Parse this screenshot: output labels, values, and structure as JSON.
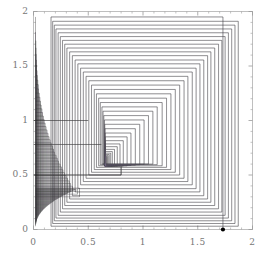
{
  "chart_data": {
    "type": "line",
    "title": "",
    "subtitle": "",
    "xlabel": "",
    "ylabel": "",
    "xlim": [
      0,
      2
    ],
    "ylim": [
      0,
      2
    ],
    "grid": false,
    "legend": null,
    "x_ticks": [
      0,
      0.5,
      1,
      1.5,
      2
    ],
    "y_ticks": [
      0,
      0.5,
      1,
      1.5,
      2
    ],
    "x_tick_labels": [
      "0",
      "0.5",
      "1",
      "1.5",
      "2"
    ],
    "y_tick_labels": [
      "0",
      "0.5",
      "1",
      "1.5",
      "2"
    ],
    "minor_ticks_per_interval": 5,
    "frame": true,
    "start_point": {
      "x": 1.73,
      "y": 0.0,
      "marker": "filled-circle"
    },
    "fixed_point": {
      "x": 0.655,
      "y": 0.58
    },
    "series": [
      {
        "name": "cobweb-orbit",
        "color": "#2a2a2a",
        "linewidth": 0.5,
        "vertices": [
          [
            1.73,
            0.0
          ],
          [
            1.73,
            1.95
          ],
          [
            0.16,
            1.95
          ],
          [
            0.16,
            0.03
          ],
          [
            1.87,
            0.03
          ],
          [
            1.87,
            1.91
          ],
          [
            0.175,
            1.91
          ],
          [
            0.175,
            0.055
          ],
          [
            1.84,
            0.055
          ],
          [
            1.84,
            1.875
          ],
          [
            0.19,
            1.875
          ],
          [
            0.19,
            0.08
          ],
          [
            1.81,
            0.08
          ],
          [
            1.81,
            1.84
          ],
          [
            0.205,
            1.84
          ],
          [
            0.205,
            0.105
          ],
          [
            1.78,
            0.105
          ],
          [
            1.78,
            1.805
          ],
          [
            0.225,
            1.805
          ],
          [
            0.225,
            0.13
          ],
          [
            1.75,
            0.13
          ],
          [
            1.75,
            1.77
          ],
          [
            0.245,
            1.77
          ],
          [
            0.245,
            0.16
          ],
          [
            1.72,
            0.16
          ],
          [
            1.72,
            1.735
          ],
          [
            0.265,
            1.735
          ],
          [
            0.265,
            0.19
          ],
          [
            1.69,
            0.19
          ],
          [
            1.69,
            1.7
          ],
          [
            0.285,
            1.7
          ],
          [
            0.285,
            0.22
          ],
          [
            1.655,
            0.22
          ],
          [
            1.655,
            1.665
          ],
          [
            0.305,
            1.665
          ],
          [
            0.305,
            0.25
          ],
          [
            1.62,
            0.25
          ],
          [
            1.62,
            1.63
          ],
          [
            0.33,
            1.63
          ],
          [
            0.33,
            0.28
          ],
          [
            1.59,
            0.28
          ],
          [
            1.59,
            1.595
          ],
          [
            0.355,
            1.595
          ],
          [
            0.355,
            0.31
          ],
          [
            1.555,
            0.31
          ],
          [
            1.555,
            1.555
          ],
          [
            0.38,
            1.555
          ],
          [
            0.38,
            0.345
          ],
          [
            1.52,
            0.345
          ],
          [
            1.52,
            1.52
          ],
          [
            0.405,
            1.52
          ],
          [
            0.405,
            0.375
          ],
          [
            1.485,
            0.375
          ],
          [
            1.485,
            1.48
          ],
          [
            0.43,
            1.48
          ],
          [
            0.43,
            0.41
          ],
          [
            1.45,
            0.41
          ],
          [
            1.45,
            1.445
          ],
          [
            0.455,
            1.445
          ],
          [
            0.455,
            0.44
          ],
          [
            1.41,
            0.44
          ],
          [
            1.41,
            1.405
          ],
          [
            0.48,
            1.405
          ],
          [
            0.48,
            0.47
          ],
          [
            1.375,
            0.47
          ],
          [
            1.375,
            1.365
          ],
          [
            0.505,
            1.365
          ],
          [
            0.505,
            0.5
          ],
          [
            1.335,
            0.5
          ],
          [
            1.335,
            1.325
          ],
          [
            0.53,
            1.325
          ],
          [
            0.53,
            0.525
          ],
          [
            1.295,
            0.525
          ],
          [
            1.295,
            1.285
          ],
          [
            0.555,
            1.285
          ],
          [
            0.555,
            0.55
          ],
          [
            1.255,
            0.55
          ],
          [
            1.255,
            1.245
          ],
          [
            0.575,
            1.245
          ],
          [
            0.575,
            0.57
          ],
          [
            1.215,
            0.57
          ],
          [
            1.215,
            1.205
          ],
          [
            0.595,
            1.205
          ],
          [
            0.595,
            0.585
          ],
          [
            1.175,
            0.585
          ],
          [
            1.175,
            1.165
          ],
          [
            0.61,
            1.165
          ],
          [
            0.61,
            0.595
          ],
          [
            1.13,
            0.595
          ],
          [
            1.13,
            1.125
          ],
          [
            0.625,
            1.125
          ],
          [
            0.625,
            0.6
          ],
          [
            1.09,
            0.6
          ],
          [
            1.09,
            1.085
          ],
          [
            0.635,
            1.085
          ],
          [
            0.635,
            0.6
          ],
          [
            1.05,
            0.6
          ],
          [
            1.05,
            1.045
          ],
          [
            0.642,
            1.045
          ],
          [
            0.642,
            0.598
          ],
          [
            1.01,
            0.598
          ],
          [
            1.01,
            1.005
          ],
          [
            0.648,
            1.005
          ],
          [
            0.648,
            0.594
          ],
          [
            0.97,
            0.594
          ],
          [
            0.97,
            0.965
          ],
          [
            0.651,
            0.965
          ],
          [
            0.651,
            0.59
          ],
          [
            0.93,
            0.59
          ],
          [
            0.93,
            0.925
          ],
          [
            0.653,
            0.925
          ],
          [
            0.653,
            0.587
          ],
          [
            0.89,
            0.587
          ],
          [
            0.89,
            0.885
          ],
          [
            0.654,
            0.885
          ],
          [
            0.654,
            0.584
          ],
          [
            0.855,
            0.584
          ],
          [
            0.855,
            0.85
          ],
          [
            0.6545,
            0.85
          ],
          [
            0.6545,
            0.582
          ],
          [
            0.82,
            0.582
          ],
          [
            0.82,
            0.815
          ],
          [
            0.655,
            0.815
          ],
          [
            0.655,
            0.581
          ],
          [
            0.79,
            0.581
          ],
          [
            0.79,
            0.785
          ],
          [
            0.655,
            0.785
          ],
          [
            0.655,
            0.58
          ],
          [
            0.765,
            0.58
          ],
          [
            0.765,
            0.76
          ],
          [
            0.655,
            0.76
          ],
          [
            0.655,
            0.58
          ],
          [
            0.74,
            0.58
          ],
          [
            0.74,
            0.735
          ],
          [
            0.655,
            0.735
          ],
          [
            0.655,
            0.58
          ],
          [
            0.72,
            0.58
          ],
          [
            0.72,
            0.715
          ],
          [
            0.655,
            0.715
          ],
          [
            0.655,
            0.58
          ],
          [
            0.705,
            0.58
          ],
          [
            0.705,
            0.7
          ],
          [
            0.655,
            0.7
          ],
          [
            0.655,
            0.58
          ],
          [
            0.692,
            0.58
          ],
          [
            0.692,
            0.688
          ],
          [
            0.655,
            0.688
          ],
          [
            0.655,
            0.58
          ],
          [
            0.682,
            0.58
          ],
          [
            0.682,
            0.678
          ],
          [
            0.655,
            0.678
          ],
          [
            0.655,
            0.58
          ],
          [
            0.674,
            0.58
          ],
          [
            0.674,
            0.67
          ],
          [
            0.655,
            0.67
          ],
          [
            0.655,
            0.58
          ],
          [
            0.668,
            0.58
          ],
          [
            0.668,
            0.664
          ],
          [
            0.655,
            0.664
          ],
          [
            0.655,
            0.58
          ],
          [
            0.663,
            0.58
          ],
          [
            0.663,
            0.659
          ],
          [
            0.655,
            0.659
          ],
          [
            0.655,
            0.58
          ]
        ]
      }
    ],
    "left_edge_cluster": {
      "description": "Dense bundle of near-vertical lines accumulating against the left edge of the frame between y=0.05 and y=1.95, plus a long horizontal segment at y~0.5 reaching from x=0 to x~0.8",
      "x_range": [
        0.02,
        0.42
      ],
      "y_range": [
        0.03,
        1.95
      ],
      "line_count": 46
    }
  },
  "axes": {
    "plot_frame_color": "#b9b9b9",
    "tick_color": "#9a9a9a",
    "label_color": "#777777",
    "background": "#ffffff"
  }
}
